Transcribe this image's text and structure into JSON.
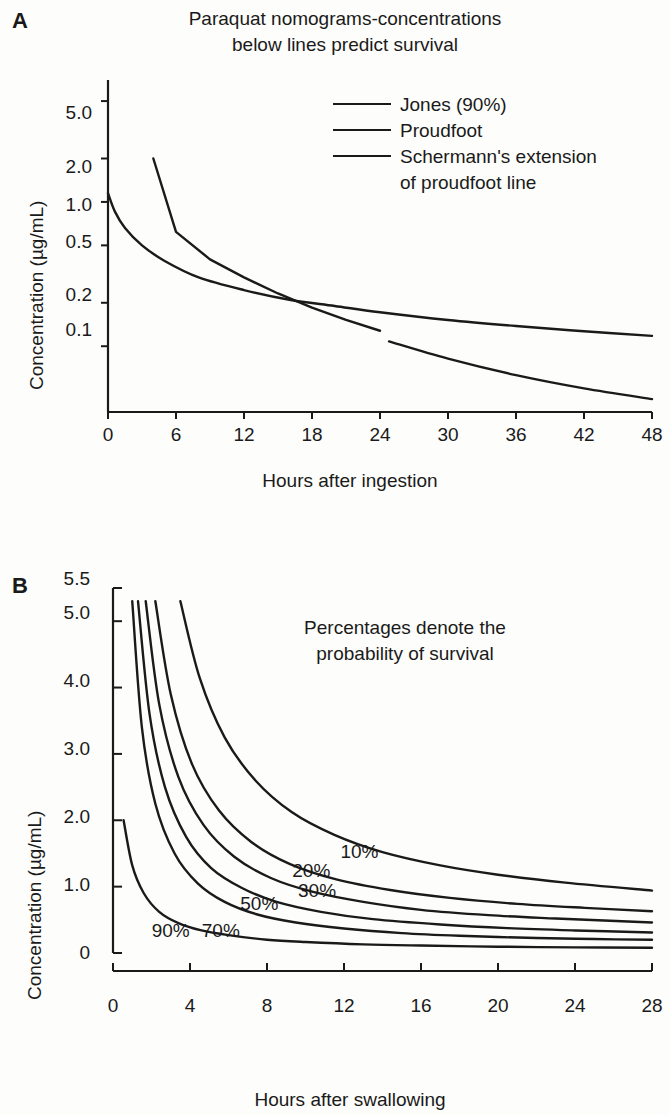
{
  "figure": {
    "panels": [
      {
        "letter": "A",
        "title": "Paraquat nomograms-concentrations\nbelow lines predict survival",
        "xlabel": "Hours after ingestion",
        "ylabel": "Concentration (µg/mL)"
      },
      {
        "letter": "B",
        "annotation": "Percentages denote the\nprobability of survival",
        "xlabel": "Hours after swallowing",
        "ylabel": "Concentration (µg/mL)"
      }
    ],
    "legend": [
      {
        "label": "Jones (90%)"
      },
      {
        "label": "Proudfoot"
      },
      {
        "label": "Schermann's extension\nof proudfoot line"
      }
    ]
  },
  "chart_data": [
    {
      "type": "line",
      "panel": "A",
      "title": "Paraquat nomograms-concentrations below lines predict survival",
      "xlabel": "Hours after ingestion",
      "ylabel": "Concentration (µg/mL)",
      "xlim": [
        0,
        48
      ],
      "ylim": [
        0.035,
        7.0
      ],
      "yscale": "log",
      "xscale": "linear",
      "grid": false,
      "legend_position": "top-right",
      "xticks": [
        0,
        6,
        12,
        18,
        24,
        30,
        36,
        42,
        48
      ],
      "yticks": [
        0.1,
        0.2,
        0.5,
        1.0,
        2.0,
        5.0
      ],
      "ytick_labels": [
        "0.1",
        "0.2",
        "0.5",
        "1.0",
        "2.0",
        "5.0"
      ],
      "series": [
        {
          "name": "Jones (90%)",
          "x": [
            0,
            0.6,
            1.5,
            3,
            5,
            8,
            12,
            16,
            20,
            24,
            30,
            36,
            42,
            48
          ],
          "y": [
            1.15,
            0.86,
            0.66,
            0.5,
            0.39,
            0.3,
            0.245,
            0.21,
            0.19,
            0.172,
            0.152,
            0.138,
            0.127,
            0.118
          ]
        },
        {
          "name": "Proudfoot",
          "x": [
            4,
            6,
            9,
            12,
            15,
            18,
            21,
            24
          ],
          "y": [
            2.0,
            0.62,
            0.4,
            0.3,
            0.232,
            0.185,
            0.152,
            0.128
          ]
        },
        {
          "name": "Schermann's extension of proudfoot line",
          "x": [
            24.8,
            30,
            36,
            42,
            48
          ],
          "y": [
            0.108,
            0.082,
            0.063,
            0.051,
            0.043
          ]
        }
      ]
    },
    {
      "type": "line",
      "panel": "B",
      "annotation": "Percentages denote the probability of survival",
      "xlabel": "Hours after swallowing",
      "ylabel": "Concentration (µg/mL)",
      "xlim": [
        0,
        28
      ],
      "ylim": [
        0,
        5.5
      ],
      "yscale": "linear",
      "xscale": "linear",
      "grid": false,
      "legend_position": "inline-labels",
      "xticks": [
        0,
        4,
        8,
        12,
        16,
        20,
        24,
        28
      ],
      "yticks": [
        0,
        1.0,
        2.0,
        3.0,
        4.0,
        5.0,
        5.5
      ],
      "ytick_labels": [
        "0",
        "1.0",
        "2.0",
        "3.0",
        "4.0",
        "5.0",
        "5.5"
      ],
      "series": [
        {
          "name": "90%",
          "label": "90%",
          "label_x": 3.0,
          "label_y": 0.33,
          "x": [
            0.55,
            1,
            1.6,
            2.4,
            3.4,
            4.6,
            6,
            8,
            10,
            13,
            16,
            20,
            24,
            28
          ],
          "y": [
            2.0,
            1.32,
            0.9,
            0.62,
            0.45,
            0.34,
            0.27,
            0.2,
            0.165,
            0.13,
            0.112,
            0.095,
            0.085,
            0.08
          ]
        },
        {
          "name": "70%",
          "label": "70%",
          "label_x": 5.6,
          "label_y": 0.33,
          "x": [
            1.0,
            1.5,
            2.2,
            3.2,
            4.4,
            5.8,
            7.5,
            9.5,
            12,
            15,
            18,
            22,
            25,
            28
          ],
          "y": [
            5.3,
            3.4,
            2.25,
            1.5,
            1.05,
            0.77,
            0.58,
            0.46,
            0.37,
            0.3,
            0.26,
            0.225,
            0.21,
            0.2
          ]
        },
        {
          "name": "50%",
          "label": "50%",
          "label_x": 7.6,
          "label_y": 0.74,
          "x": [
            1.3,
            1.9,
            2.7,
            3.8,
            5.1,
            6.7,
            8.5,
            10.8,
            13.5,
            17,
            20.5,
            24,
            28
          ],
          "y": [
            5.3,
            3.6,
            2.5,
            1.75,
            1.28,
            0.98,
            0.77,
            0.62,
            0.51,
            0.43,
            0.375,
            0.34,
            0.31
          ]
        },
        {
          "name": "30%",
          "label": "30%",
          "label_x": 10.6,
          "label_y": 0.93,
          "x": [
            1.7,
            2.4,
            3.4,
            4.7,
            6.3,
            8.2,
            10.4,
            13,
            16,
            19.5,
            23,
            28
          ],
          "y": [
            5.3,
            3.75,
            2.65,
            1.93,
            1.45,
            1.13,
            0.92,
            0.77,
            0.65,
            0.57,
            0.52,
            0.46
          ]
        },
        {
          "name": "20%",
          "label": "20%",
          "label_x": 10.3,
          "label_y": 1.23,
          "x": [
            2.2,
            3.0,
            4.1,
            5.5,
            7.2,
            9.2,
            11.6,
            14.4,
            17.5,
            21,
            24.5,
            28
          ],
          "y": [
            5.3,
            3.9,
            2.85,
            2.15,
            1.67,
            1.34,
            1.11,
            0.95,
            0.83,
            0.74,
            0.68,
            0.63
          ]
        },
        {
          "name": "10%",
          "label": "10%",
          "label_x": 12.8,
          "label_y": 1.52,
          "x": [
            3.5,
            4.5,
            5.8,
            7.4,
            9.3,
            11.5,
            14,
            17,
            20,
            23.5,
            28
          ],
          "y": [
            5.3,
            4.15,
            3.25,
            2.6,
            2.12,
            1.78,
            1.52,
            1.32,
            1.18,
            1.06,
            0.94
          ]
        }
      ]
    }
  ]
}
